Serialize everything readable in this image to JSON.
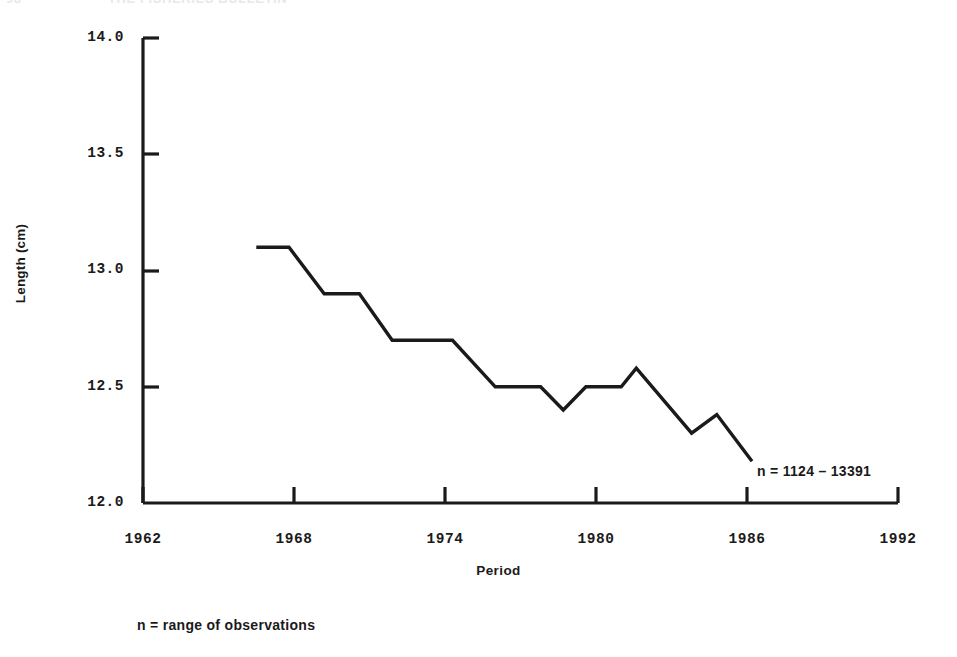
{
  "running_head": {
    "page_number": "98",
    "title": "THE FISHERIES BULLETIN"
  },
  "chart_data": {
    "type": "line",
    "title": "",
    "subtitle": "",
    "xlabel": "Period",
    "ylabel": "Length (cm)",
    "xlim": [
      1962,
      1992
    ],
    "ylim": [
      12.0,
      14.0
    ],
    "grid": false,
    "legend": "none",
    "line_color": "#000000",
    "background_color": "#ffffff",
    "xticks": [
      "1962",
      "1968",
      "1974",
      "1980",
      "1986",
      "1992"
    ],
    "xtick_values": [
      1962,
      1968,
      1974,
      1980,
      1986,
      1992
    ],
    "yticks": [
      "12.0",
      "12.5",
      "13.0",
      "13.5",
      "14.0"
    ],
    "ytick_values": [
      12.0,
      12.5,
      13.0,
      13.5,
      14.0
    ],
    "x": [
      1966.5,
      1967.8,
      1967.8,
      1969.1,
      1970.5,
      1973.5,
      1975.3,
      1977.5,
      1978.3,
      1979.3,
      1981.4,
      1983.6,
      1984.8,
      1986.1
    ],
    "values": [
      13.1,
      13.1,
      12.9,
      12.9,
      12.7,
      12.7,
      12.5,
      12.5,
      12.4,
      12.5,
      12.58,
      12.3,
      12.38,
      12.18
    ],
    "points": [
      {
        "x": 1966.5,
        "y": 13.1
      },
      {
        "x": 1967.8,
        "y": 13.1
      },
      {
        "x": 1969.2,
        "y": 12.9
      },
      {
        "x": 1970.6,
        "y": 12.9
      },
      {
        "x": 1971.9,
        "y": 12.7
      },
      {
        "x": 1974.3,
        "y": 12.7
      },
      {
        "x": 1976.0,
        "y": 12.5
      },
      {
        "x": 1977.8,
        "y": 12.5
      },
      {
        "x": 1978.7,
        "y": 12.4
      },
      {
        "x": 1979.6,
        "y": 12.5
      },
      {
        "x": 1981.0,
        "y": 12.5
      },
      {
        "x": 1981.6,
        "y": 12.58
      },
      {
        "x": 1983.8,
        "y": 12.3
      },
      {
        "x": 1984.8,
        "y": 12.38
      },
      {
        "x": 1986.2,
        "y": 12.18
      }
    ],
    "annotations": [
      {
        "name": "sample-size",
        "text": "n = 1124 – 13391",
        "x": 1986.5,
        "y": 12.22
      }
    ]
  },
  "annotation_text": "n = 1124 – 13391",
  "footnote_text": "n = range of observations"
}
